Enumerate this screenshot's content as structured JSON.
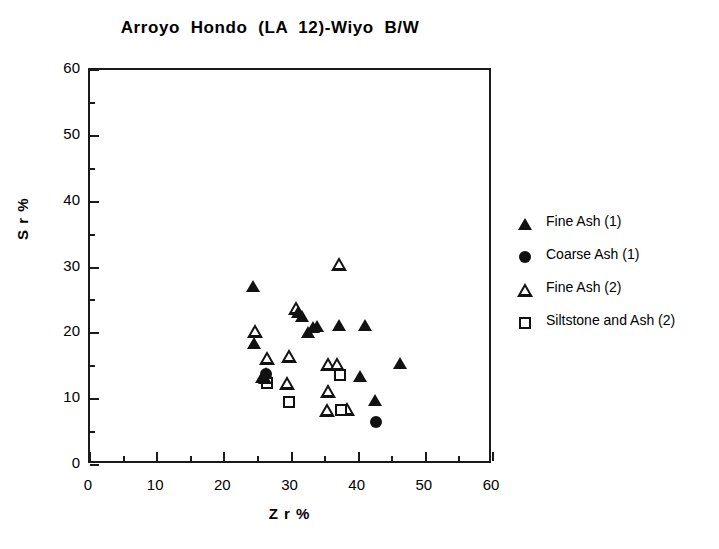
{
  "chart_data": {
    "type": "scatter",
    "title": "Arroyo  Hondo  (LA  12)-Wiyo  B/W",
    "xlabel": "Z r %",
    "ylabel": "S r %",
    "xlim": [
      0,
      60
    ],
    "ylim": [
      0,
      60
    ],
    "xticks": [
      0,
      10,
      20,
      30,
      40,
      50,
      60
    ],
    "yticks": [
      0,
      10,
      20,
      30,
      40,
      50,
      60
    ],
    "x_minor_ticks": [
      5,
      15,
      25,
      35,
      45,
      55
    ],
    "y_minor_ticks": [
      5,
      15,
      25,
      35,
      45,
      55
    ],
    "grid": false,
    "legend_position": "right",
    "series": [
      {
        "name": "Fine Ash (1)",
        "marker": "triangle-filled",
        "color": "#111111",
        "points": [
          [
            24.2,
            27.2
          ],
          [
            24.4,
            18.6
          ],
          [
            25.6,
            13.4
          ],
          [
            26.0,
            13.2
          ],
          [
            26.2,
            13.9
          ],
          [
            31.0,
            23.3
          ],
          [
            31.6,
            22.6
          ],
          [
            33.2,
            20.9
          ],
          [
            33.8,
            21.1
          ],
          [
            32.4,
            20.2
          ],
          [
            37.0,
            21.3
          ],
          [
            41.0,
            21.2
          ],
          [
            40.2,
            13.5
          ],
          [
            42.4,
            9.9
          ],
          [
            46.2,
            15.5
          ]
        ]
      },
      {
        "name": "Coarse Ash (1)",
        "marker": "circle-filled",
        "color": "#111111",
        "points": [
          [
            26.2,
            13.8
          ],
          [
            42.6,
            6.6
          ]
        ]
      },
      {
        "name": "Fine Ash (2)",
        "marker": "triangle-open",
        "color": "#111111",
        "points": [
          [
            24.6,
            20.3
          ],
          [
            26.4,
            16.3
          ],
          [
            29.6,
            16.6
          ],
          [
            30.6,
            23.9
          ],
          [
            37.0,
            30.5
          ],
          [
            35.4,
            15.4
          ],
          [
            36.8,
            15.3
          ],
          [
            35.4,
            11.2
          ],
          [
            35.3,
            8.4
          ],
          [
            29.4,
            12.4
          ],
          [
            38.2,
            8.5
          ]
        ]
      },
      {
        "name": "Siltstone and Ash (2)",
        "marker": "square-open",
        "color": "#111111",
        "points": [
          [
            26.4,
            12.4
          ],
          [
            29.6,
            9.6
          ],
          [
            37.2,
            13.6
          ],
          [
            37.4,
            8.3
          ]
        ]
      }
    ]
  },
  "legend": {
    "items": [
      {
        "label": "Fine Ash (1)",
        "marker": "triangle-filled"
      },
      {
        "label": "Coarse Ash (1)",
        "marker": "circle-filled"
      },
      {
        "label": "Fine Ash (2)",
        "marker": "triangle-open"
      },
      {
        "label": "Siltstone and Ash (2)",
        "marker": "square-open"
      }
    ]
  }
}
